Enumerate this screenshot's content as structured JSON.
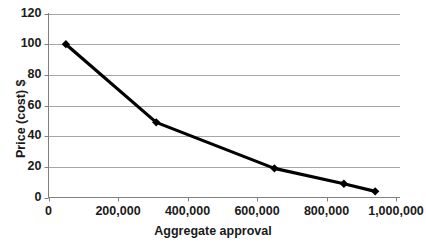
{
  "chart_data": {
    "type": "line",
    "title": "",
    "xlabel": "Aggregate approval",
    "ylabel": "Price (cost) $",
    "xlim": [
      0,
      1000000
    ],
    "ylim": [
      0,
      120
    ],
    "grid": true,
    "legend": false,
    "legend_position": "none",
    "line_color": "#000000",
    "marker": "diamond",
    "x_tick_labels": [
      "0",
      "200,000",
      "400,000",
      "600,000",
      "800,000",
      "1,000,000"
    ],
    "x_ticks": [
      0,
      200000,
      400000,
      600000,
      800000,
      1000000
    ],
    "y_tick_labels": [
      "0",
      "20",
      "40",
      "60",
      "80",
      "100",
      "120"
    ],
    "y_ticks": [
      0,
      20,
      40,
      60,
      80,
      100,
      120
    ],
    "series": [
      {
        "name": "Price vs aggregate approval",
        "x": [
          50000,
          310000,
          650000,
          850000,
          940000
        ],
        "values": [
          100,
          49,
          19,
          9,
          4
        ]
      }
    ]
  }
}
